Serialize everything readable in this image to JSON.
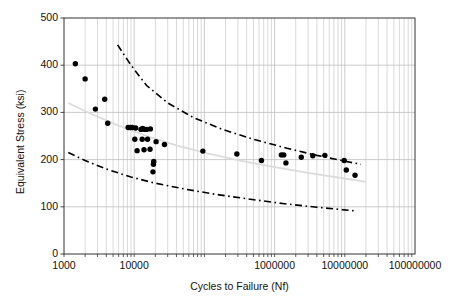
{
  "chart_data": {
    "type": "scatter",
    "title": "",
    "xlabel": "Cycles to Failure (Nf)",
    "ylabel": "Equivalent Stress (ksi)",
    "xscale": "log",
    "yscale": "linear",
    "xlim": [
      1000,
      100000000
    ],
    "ylim": [
      0,
      500
    ],
    "grid": true,
    "legend": "none",
    "xticks": [
      {
        "value": 1000,
        "label": "1000"
      },
      {
        "value": 10000,
        "label": "10000"
      },
      {
        "value": 100000,
        "label": ""
      },
      {
        "value": 1000000,
        "label": "1000000"
      },
      {
        "value": 10000000,
        "label": "10000000"
      },
      {
        "value": 100000000,
        "label": "100000000"
      }
    ],
    "yticks": [
      {
        "value": 0,
        "label": "0"
      },
      {
        "value": 100,
        "label": "100"
      },
      {
        "value": 200,
        "label": "200"
      },
      {
        "value": 300,
        "label": "300"
      },
      {
        "value": 400,
        "label": "400"
      },
      {
        "value": 500,
        "label": "500"
      }
    ],
    "series": [
      {
        "name": "Fatigue test data",
        "type": "scatter",
        "marker": "circle",
        "color": "#000000",
        "points": [
          [
            1450,
            403
          ],
          [
            2000,
            371
          ],
          [
            2800,
            307
          ],
          [
            3800,
            328
          ],
          [
            4200,
            277
          ],
          [
            8200,
            268
          ],
          [
            8800,
            268
          ],
          [
            9400,
            268
          ],
          [
            10500,
            267
          ],
          [
            12500,
            264
          ],
          [
            13200,
            266
          ],
          [
            14200,
            264
          ],
          [
            15000,
            264
          ],
          [
            10200,
            243
          ],
          [
            13000,
            243
          ],
          [
            15500,
            243
          ],
          [
            11000,
            219
          ],
          [
            13800,
            221
          ],
          [
            16800,
            222
          ],
          [
            18500,
            174
          ],
          [
            18800,
            190
          ],
          [
            19000,
            196
          ],
          [
            20500,
            238
          ],
          [
            17000,
            265
          ],
          [
            27000,
            232
          ],
          [
            95000,
            218
          ],
          [
            290000,
            212
          ],
          [
            650000,
            198
          ],
          [
            1250000,
            210
          ],
          [
            1350000,
            210
          ],
          [
            1450000,
            193
          ],
          [
            2400000,
            205
          ],
          [
            3500000,
            208
          ],
          [
            5200000,
            209
          ],
          [
            9800000,
            198
          ],
          [
            10500000,
            178
          ],
          [
            14000000,
            167
          ]
        ]
      },
      {
        "name": "Upper bound (+3 sigma)",
        "type": "line",
        "style": "dash-dot",
        "color": "#000000",
        "points": [
          [
            5800,
            443
          ],
          [
            9000,
            400
          ],
          [
            15000,
            357
          ],
          [
            30000,
            320
          ],
          [
            70000,
            289
          ],
          [
            180000,
            264
          ],
          [
            500000,
            243
          ],
          [
            1500000,
            224
          ],
          [
            4000000,
            209
          ],
          [
            9000000,
            198
          ],
          [
            17000000,
            190
          ]
        ]
      },
      {
        "name": "Lower bound (-3 sigma)",
        "type": "line",
        "style": "dash-dot",
        "color": "#000000",
        "points": [
          [
            1150,
            215
          ],
          [
            2000,
            198
          ],
          [
            4000,
            180
          ],
          [
            9000,
            163
          ],
          [
            20000,
            150
          ],
          [
            55000,
            137
          ],
          [
            150000,
            126
          ],
          [
            450000,
            116
          ],
          [
            1300000,
            107
          ],
          [
            4000000,
            99
          ],
          [
            9000000,
            94
          ],
          [
            15000000,
            91
          ]
        ]
      },
      {
        "name": "Mean curve",
        "type": "line",
        "style": "solid-light",
        "color": "#dcdcdc",
        "points": [
          [
            1150,
            320
          ],
          [
            2500,
            296
          ],
          [
            6000,
            272
          ],
          [
            15000,
            250
          ],
          [
            40000,
            230
          ],
          [
            110000,
            213
          ],
          [
            350000,
            197
          ],
          [
            1000000,
            184
          ],
          [
            3000000,
            172
          ],
          [
            9000000,
            161
          ],
          [
            20000000,
            153
          ]
        ]
      }
    ],
    "colors": {
      "grid_major": "#bfbfbf",
      "grid_minor": "#c8c8c8",
      "axis": "#333333",
      "marker": "#000000",
      "bound_line": "#000000",
      "mean_line": "#dcdcdc",
      "background": "#ffffff"
    },
    "geometry": {
      "plot_left": 64,
      "plot_top": 18,
      "plot_right": 415,
      "plot_bottom": 254
    }
  }
}
